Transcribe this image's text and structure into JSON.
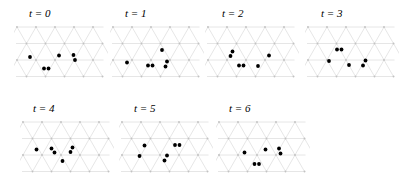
{
  "figure": {
    "type": "lattice-gas-time-series",
    "width": 419,
    "height": 195,
    "background_color": "#ffffff",
    "lattice_line_color": "#d2d2d2",
    "lattice_node_color": "#c2c2c2",
    "particle_color": "#000000"
  },
  "lattice": {
    "geometry": "triangular",
    "columns": 5,
    "rows": 4,
    "spacing_x": 19,
    "spacing_y": 16.5,
    "row_offset_x": 9.5,
    "node_radius": 0.9,
    "particle_radius": 1.9
  },
  "panels": [
    {
      "id": "panel-t0",
      "label": "t = 0",
      "label_x": 29,
      "label_y": 8,
      "plot_x": 14,
      "plot_y": 24,
      "particle_count": 6,
      "particles": [
        {
          "x": 16.0,
          "y": 33.0
        },
        {
          "x": 45.0,
          "y": 31.5
        },
        {
          "x": 59.5,
          "y": 31.0
        },
        {
          "x": 61.0,
          "y": 36.0
        },
        {
          "x": 30.0,
          "y": 44.5
        },
        {
          "x": 34.5,
          "y": 44.5
        }
      ]
    },
    {
      "id": "panel-t1",
      "label": "t = 1",
      "label_x": 125,
      "label_y": 8,
      "plot_x": 110,
      "plot_y": 24,
      "particle_count": 6,
      "particles": [
        {
          "x": 52.0,
          "y": 26.0
        },
        {
          "x": 17.0,
          "y": 38.5
        },
        {
          "x": 38.0,
          "y": 41.5
        },
        {
          "x": 42.5,
          "y": 41.5
        },
        {
          "x": 57.0,
          "y": 37.5
        },
        {
          "x": 55.5,
          "y": 42.5
        }
      ]
    },
    {
      "id": "panel-t2",
      "label": "t = 2",
      "label_x": 222,
      "label_y": 8,
      "plot_x": 205,
      "plot_y": 24,
      "particle_count": 6,
      "particles": [
        {
          "x": 27.5,
          "y": 27.5
        },
        {
          "x": 25.5,
          "y": 32.0
        },
        {
          "x": 64.0,
          "y": 31.5
        },
        {
          "x": 34.0,
          "y": 41.5
        },
        {
          "x": 38.5,
          "y": 41.5
        },
        {
          "x": 53.0,
          "y": 42.0
        }
      ]
    },
    {
      "id": "panel-t3",
      "label": "t = 3",
      "label_x": 321,
      "label_y": 8,
      "plot_x": 305,
      "plot_y": 24,
      "particle_count": 6,
      "particles": [
        {
          "x": 32.0,
          "y": 25.5
        },
        {
          "x": 36.5,
          "y": 25.5
        },
        {
          "x": 24.0,
          "y": 37.0
        },
        {
          "x": 44.0,
          "y": 41.0
        },
        {
          "x": 60.5,
          "y": 36.5
        },
        {
          "x": 58.0,
          "y": 41.5
        }
      ]
    },
    {
      "id": "panel-t4",
      "label": "t = 4",
      "label_x": 33,
      "label_y": 103,
      "plot_x": 20,
      "plot_y": 119,
      "particle_count": 6,
      "particles": [
        {
          "x": 16.5,
          "y": 30.5
        },
        {
          "x": 31.5,
          "y": 29.5
        },
        {
          "x": 34.5,
          "y": 33.5
        },
        {
          "x": 52.5,
          "y": 28.5
        },
        {
          "x": 50.5,
          "y": 33.0
        },
        {
          "x": 42.5,
          "y": 42.0
        }
      ]
    },
    {
      "id": "panel-t5",
      "label": "t = 5",
      "label_x": 134,
      "label_y": 103,
      "plot_x": 119,
      "plot_y": 119,
      "particle_count": 6,
      "particles": [
        {
          "x": 25.5,
          "y": 26.5
        },
        {
          "x": 56.0,
          "y": 26.0
        },
        {
          "x": 60.5,
          "y": 26.0
        },
        {
          "x": 20.5,
          "y": 37.0
        },
        {
          "x": 48.0,
          "y": 36.5
        },
        {
          "x": 45.5,
          "y": 41.5
        }
      ]
    },
    {
      "id": "panel-t6",
      "label": "t = 6",
      "label_x": 229,
      "label_y": 103,
      "plot_x": 216,
      "plot_y": 119,
      "particle_count": 6,
      "particles": [
        {
          "x": 28.5,
          "y": 33.5
        },
        {
          "x": 49.5,
          "y": 30.5
        },
        {
          "x": 63.0,
          "y": 29.5
        },
        {
          "x": 64.5,
          "y": 34.5
        },
        {
          "x": 38.5,
          "y": 45.0
        },
        {
          "x": 43.0,
          "y": 45.0
        }
      ]
    }
  ]
}
